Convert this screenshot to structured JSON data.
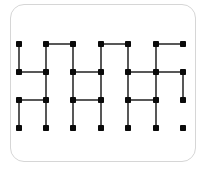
{
  "diagram": {
    "type": "dot-grid-line-pattern",
    "colors": {
      "line": "#111111",
      "dot": "#0a0a0a",
      "card_border": "#d6d6d6",
      "background": "#ffffff"
    },
    "columns_x": [
      19,
      46,
      73,
      101,
      128,
      156,
      183
    ],
    "rows_y": [
      44,
      72,
      100,
      128
    ],
    "dot_size": 6,
    "segments": [
      {
        "from": [
          1,
          0
        ],
        "to": [
          2,
          0
        ]
      },
      {
        "from": [
          3,
          0
        ],
        "to": [
          4,
          0
        ]
      },
      {
        "from": [
          5,
          0
        ],
        "to": [
          6,
          0
        ]
      },
      {
        "from": [
          0,
          0
        ],
        "to": [
          0,
          1
        ]
      },
      {
        "from": [
          1,
          0
        ],
        "to": [
          1,
          1
        ]
      },
      {
        "from": [
          2,
          0
        ],
        "to": [
          2,
          1
        ]
      },
      {
        "from": [
          3,
          0
        ],
        "to": [
          3,
          1
        ]
      },
      {
        "from": [
          4,
          0
        ],
        "to": [
          4,
          1
        ]
      },
      {
        "from": [
          5,
          0
        ],
        "to": [
          5,
          1
        ]
      },
      {
        "from": [
          0,
          1
        ],
        "to": [
          1,
          1
        ]
      },
      {
        "from": [
          2,
          1
        ],
        "to": [
          3,
          1
        ]
      },
      {
        "from": [
          4,
          1
        ],
        "to": [
          5,
          1
        ]
      },
      {
        "from": [
          5,
          1
        ],
        "to": [
          6,
          1
        ]
      },
      {
        "from": [
          1,
          1
        ],
        "to": [
          1,
          2
        ]
      },
      {
        "from": [
          2,
          1
        ],
        "to": [
          2,
          2
        ]
      },
      {
        "from": [
          3,
          1
        ],
        "to": [
          3,
          2
        ]
      },
      {
        "from": [
          4,
          1
        ],
        "to": [
          4,
          2
        ]
      },
      {
        "from": [
          5,
          1
        ],
        "to": [
          5,
          2
        ]
      },
      {
        "from": [
          6,
          1
        ],
        "to": [
          6,
          2
        ]
      },
      {
        "from": [
          0,
          2
        ],
        "to": [
          1,
          2
        ]
      },
      {
        "from": [
          2,
          2
        ],
        "to": [
          3,
          2
        ]
      },
      {
        "from": [
          4,
          2
        ],
        "to": [
          5,
          2
        ]
      },
      {
        "from": [
          0,
          2
        ],
        "to": [
          0,
          3
        ]
      },
      {
        "from": [
          1,
          2
        ],
        "to": [
          1,
          3
        ]
      },
      {
        "from": [
          2,
          2
        ],
        "to": [
          2,
          3
        ]
      },
      {
        "from": [
          3,
          2
        ],
        "to": [
          3,
          3
        ]
      },
      {
        "from": [
          4,
          2
        ],
        "to": [
          4,
          3
        ]
      },
      {
        "from": [
          5,
          2
        ],
        "to": [
          5,
          3
        ]
      }
    ]
  }
}
